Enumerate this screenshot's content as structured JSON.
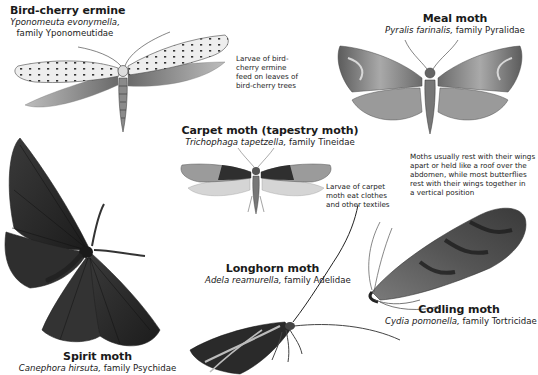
{
  "specimens": [
    {
      "id": "bird_cherry_ermine",
      "common_name": "Bird-cherry ermine",
      "scientific_name": "Yponomeuta evonymella,",
      "family": "family Yponomeutidae"
    },
    {
      "id": "meal_moth",
      "common_name": "Meal moth",
      "scientific_name": "Pyralis farinalis,",
      "family": "family Pyralidae"
    },
    {
      "id": "carpet_moth",
      "common_name": "Carpet moth (tapestry moth)",
      "scientific_name": "Trichophaga tapetzella,",
      "family": "family Tineidae"
    },
    {
      "id": "longhorn_moth",
      "common_name": "Longhorn moth",
      "scientific_name": "Adela reamurella,",
      "family": "family Adelidae"
    },
    {
      "id": "codling_moth",
      "common_name": "Codling moth",
      "scientific_name": "Cydia pomonella,",
      "family": "family Tortricidae"
    },
    {
      "id": "spirit_moth",
      "common_name": "Spirit moth",
      "scientific_name": "Canephora hirsuta,",
      "family": "family Psychidae"
    }
  ],
  "notes": {
    "bird_cherry_larvae": [
      "Larvae of bird-",
      "cherry ermine",
      "feed on leaves of",
      "bird-cherry trees"
    ],
    "carpet_larvae": [
      "Larvae of carpet",
      "moth eat clothes",
      "and other textiles"
    ],
    "resting_posture": [
      "Moths usually rest with their wings",
      "apart or held like a roof over the",
      "abdomen, while most butterflies",
      "rest with their wings together in",
      "a vertical position"
    ]
  },
  "colors": {
    "background": "#ffffff",
    "text": "#1a1a1a",
    "illustration_dark": "#2a2a2a",
    "illustration_mid": "#7a7a7a",
    "illustration_light": "#c8c8c8"
  }
}
